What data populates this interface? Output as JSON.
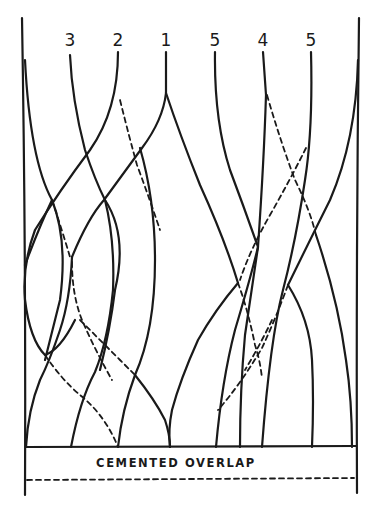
{
  "diagram": {
    "type": "hand-drawn strand/ply overlap diagram",
    "strand_labels": [
      {
        "text": "3",
        "x": 70
      },
      {
        "text": "2",
        "x": 118
      },
      {
        "text": "1",
        "x": 166
      },
      {
        "text": "5",
        "x": 215
      },
      {
        "text": "4",
        "x": 263
      },
      {
        "text": "5",
        "x": 311
      }
    ],
    "base_caption": "CEMENTED OVERLAP",
    "line_color": "#1a1a1a",
    "background": "#ffffff"
  }
}
